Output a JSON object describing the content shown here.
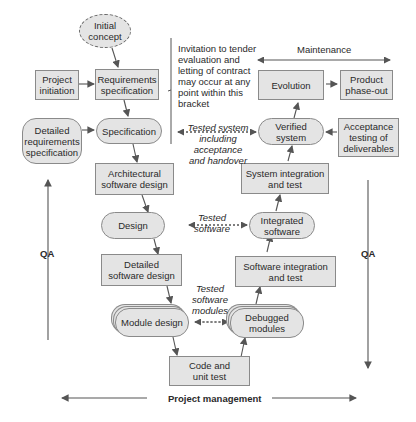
{
  "diagram": {
    "nodes": {
      "initial_concept": "Initial\nconcept",
      "project_initiation": "Project\ninitiation",
      "requirements_specification": "Requirements\nspecification",
      "detailed_requirements_specification": "Detailed\nrequirements\nspecification",
      "specification": "Specification",
      "architectural_software_design": "Architectural\nsoftware design",
      "design": "Design",
      "detailed_software_design": "Detailed\nsoftware design",
      "module_design": "Module design",
      "code_and_unit_test": "Code and\nunit test",
      "debugged_modules": "Debugged\nmodules",
      "software_integration_and_test": "Software integration\nand test",
      "integrated_software": "Integrated\nsoftware",
      "system_integration_and_test": "System integration\nand test",
      "verified_system": "Verified\nsystem",
      "acceptance_testing": "Acceptance\ntesting of\ndeliverables",
      "evolution": "Evolution",
      "product_phase_out": "Product\nphase-out"
    },
    "annotations": {
      "tender_note": "Invitation to tender\nevaluation and\nletting of contract\nmay occur at any\npoint within this\nbracket",
      "maintenance": "Maintenance",
      "tested_system": "Tested system\nincluding\nacceptance\nand handover",
      "tested_software": "Tested\nsoftware",
      "tested_software_modules": "Tested\nsoftware\nmodules",
      "qa_left": "QA",
      "qa_right": "QA",
      "project_management": "Project management"
    },
    "colors": {
      "box_fill": "#e4e4e4",
      "box_border": "#8a8a8a",
      "arrow": "#555555",
      "text": "#2a2a2a"
    }
  }
}
